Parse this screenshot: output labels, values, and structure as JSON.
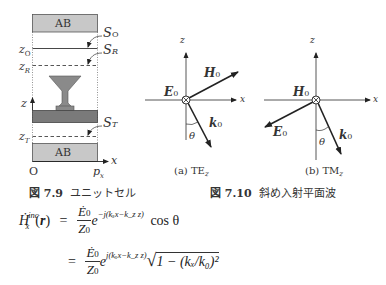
{
  "figure_7_9": {
    "caption_label": "図 7.9",
    "caption_text": "ユニットセル",
    "absorbing_boundary_label": "AB",
    "labels": {
      "S_O": "S",
      "S_O_sub": "O",
      "S_R": "S",
      "S_R_sub": "R",
      "S_T": "S",
      "S_T_sub": "T",
      "z_O": "z",
      "z_O_sub": "O",
      "z_R": "z",
      "z_R_sub": "R",
      "z_T": "z",
      "z_T_sub": "T",
      "z_axis": "z",
      "x_axis": "x",
      "origin": "O",
      "p_x": "p",
      "p_x_sub": "x"
    },
    "colors": {
      "ab_fill": "#c8c8c8",
      "slab_fill": "#7a7a7a",
      "funnel_fill": "#8a8a8a"
    }
  },
  "figure_7_10": {
    "caption_label": "図 7.10",
    "caption_text": "斜め入射平面波",
    "subfigures": [
      {
        "caption": "(a) TE",
        "caption_sub": "z",
        "E_label": "E",
        "E_sub": "0",
        "H_label": "H",
        "H_sub": "0",
        "k_label": "k",
        "k_sub": "0",
        "theta": "θ",
        "z_axis": "z",
        "x_axis": "x"
      },
      {
        "caption": "(b) TM",
        "caption_sub": "z",
        "E_label": "E",
        "E_sub": "0",
        "H_label": "H",
        "H_sub": "0",
        "k_label": "k",
        "k_sub": "0",
        "theta": "θ",
        "z_axis": "z",
        "x_axis": "x"
      }
    ]
  },
  "equation": {
    "lhs_H": "Ḣ",
    "lhs_sub": "x",
    "lhs_sup": "inc",
    "lhs_arg_open": "(",
    "lhs_arg": "r",
    "lhs_arg_close": ")",
    "eq_sign": "=",
    "num": "Ė",
    "num_sub": "0",
    "den": "Z",
    "den_sub": "0",
    "line1_exp_base": "e",
    "line1_exponent": "−j(kₓx−kₓz)",
    "line1_exponent_display": "−j(kₓx−k_z z)",
    "line1_tail": "cos θ",
    "line2_exponent_display": "j(kₓx−k_z z)",
    "line2_sqrt": "1 − (kₓ/k₀)²"
  }
}
